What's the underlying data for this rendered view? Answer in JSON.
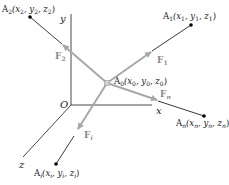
{
  "diagram": {
    "axes": {
      "x_label": "x",
      "y_label": "y",
      "z_label": "z",
      "origin_label": "O"
    },
    "center_point": {
      "name": "A",
      "sub": "0",
      "coords": "(x",
      "label_full": "A0(x0, y0, z0)"
    },
    "points": [
      {
        "id": "A1",
        "label_full": "A1(x1, y1, z1)",
        "force": "F1"
      },
      {
        "id": "A2",
        "label_full": "A2(x2, y2, z2)",
        "force": "F2"
      },
      {
        "id": "An",
        "label_full": "An(xn, yn, zn)",
        "force": "Fn"
      },
      {
        "id": "Ai",
        "label_full": "Ai(xi, yi, zi)",
        "force": "Fi"
      }
    ],
    "text": {
      "A": "A",
      "F": "F",
      "open": "(x",
      "comma_y": ", y",
      "comma_z": ", z",
      "close": ")",
      "sub0": "0",
      "sub1": "1",
      "sub2": "2",
      "subn": "n",
      "subi": "i"
    },
    "colors": {
      "axis": "#333333",
      "line": "#222222",
      "force_arrow": "#a8a8a8",
      "point": "#000000",
      "force_label": "#8a8a8a"
    }
  }
}
